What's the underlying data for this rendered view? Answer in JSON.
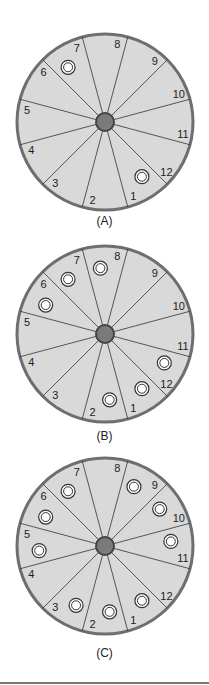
{
  "figure": {
    "wheel_colors": {
      "face": "#d9d9d9",
      "rim": "#6e6e6e",
      "spoke": "#333333",
      "hub": "#7a7a7a",
      "hub_ring": "#444444",
      "marker_fill": "#ffffff",
      "marker_stroke": "#333333"
    },
    "panels": [
      {
        "caption": "(A)",
        "markers": [
          7,
          1
        ]
      },
      {
        "caption": "(B)",
        "markers": [
          6,
          7,
          8,
          12,
          1,
          2
        ]
      },
      {
        "caption": "(C)",
        "markers": [
          3,
          2,
          1,
          5,
          6,
          7,
          9,
          10,
          11
        ]
      }
    ],
    "segment_labels": [
      "1",
      "2",
      "3",
      "4",
      "5",
      "6",
      "7",
      "8",
      "9",
      "10",
      "11",
      "12"
    ]
  }
}
